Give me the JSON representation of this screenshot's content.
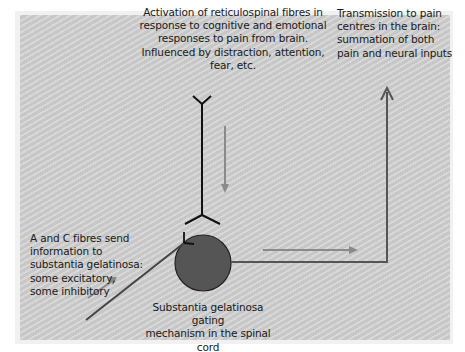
{
  "diagram": {
    "colors": {
      "background": "#cfcfcf",
      "frame": "#f1f1f1",
      "neuron_line": "#111111",
      "flow_arrow": "#8a8a8a",
      "output_path": "#555555",
      "gate_cell_fill": "#555555",
      "text": "#1a1a1a"
    },
    "labels": {
      "descending": "Activation of reticulospinal fibres in response to cognitive and emotional responses to pain from brain. Influenced by distraction, attention, fear, etc.",
      "descending_lines": [
        "Activation of reticulospinal fibres in",
        "response to cognitive and emotional",
        "responses to pain from brain.",
        "Influenced by distraction, attention,",
        "fear, etc."
      ],
      "ascending_lines": [
        "Transmission to pain",
        "centres in the brain:",
        "summation of both",
        "pain and neural inputs"
      ],
      "afferent_lines": [
        "A and C fibres send",
        "information to",
        "substantia gelatinosa:",
        "some excitatory,",
        "some inhibitory"
      ],
      "gate_lines": [
        "Substantia gelatinosa gating",
        "mechanism in the spinal cord"
      ]
    },
    "nodes": [
      {
        "id": "reticulospinal-neuron",
        "type": "fibre",
        "direction": "down"
      },
      {
        "id": "substantia-gelatinosa",
        "type": "cell",
        "shape": "circle"
      },
      {
        "id": "afferent-fibre",
        "type": "fibre",
        "direction": "up-right"
      },
      {
        "id": "ascending-pathway",
        "type": "pathway",
        "direction": "up"
      }
    ],
    "edges": [
      {
        "from": "brain",
        "to": "substantia-gelatinosa",
        "via": "reticulospinal-neuron"
      },
      {
        "from": "afferent-fibre",
        "to": "substantia-gelatinosa"
      },
      {
        "from": "substantia-gelatinosa",
        "to": "pain-centres-in-brain",
        "via": "ascending-pathway"
      }
    ]
  }
}
